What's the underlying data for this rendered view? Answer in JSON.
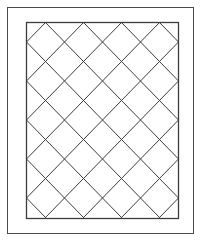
{
  "figure": {
    "canvas": {
      "width": 203,
      "height": 243
    },
    "background_color": "#ffffff"
  },
  "outer_frame": {
    "label": "outer frame border",
    "x": 7.5,
    "y": 7.5,
    "width": 186,
    "height": 226,
    "stroke_color": "#4a4a4a",
    "stroke_width": 1
  },
  "inner_panel": {
    "label": "inner lattice panel",
    "x": 26.5,
    "y": 22.5,
    "width": 152,
    "height": 196,
    "fill_color": "#ffffff",
    "stroke_color": "#3c3c3c",
    "stroke_width": 1.3
  },
  "lattice": {
    "label": "diagonal diamond lattice",
    "pattern": "45-degree crossing diagonals",
    "cell_width": 38,
    "cell_height": 39,
    "top_apex_count": 4,
    "bottom_apex_count": 4,
    "left_vertex_count": 5,
    "right_vertex_count": 5,
    "stroke_color": "#3c3c3c",
    "stroke_width": 1,
    "top_apex_x": [
      45.5,
      83.5,
      121.5,
      159.5
    ],
    "bottom_apex_x": [
      45.5,
      83.5,
      121.5,
      159.5
    ],
    "left_vertex_y": [
      42,
      81,
      120,
      159,
      198
    ],
    "right_vertex_y": [
      42,
      81,
      120,
      159,
      198
    ]
  },
  "chart_data": {
    "type": "diagram",
    "xlabel": "",
    "ylabel": "",
    "series": [
      {
        "name": "down-right diagonals",
        "direction": "down-right",
        "count": 9,
        "values": []
      },
      {
        "name": "down-left diagonals",
        "direction": "down-left",
        "count": 9,
        "values": []
      }
    ],
    "grid": true,
    "legend": "none"
  }
}
